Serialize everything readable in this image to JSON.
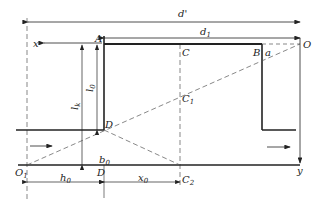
{
  "diagram": {
    "type": "geometric construction",
    "labels": {
      "d_prime": "d'",
      "d1": "d",
      "d1_sub": "1",
      "x_axis": "x",
      "y_axis": "y",
      "A": "A",
      "B": "B",
      "a": "a",
      "C": "C",
      "C1": "C",
      "C1_sub": "1",
      "C2": "C",
      "C2_sub": "2",
      "D_upper": "D",
      "D_lower": "D",
      "O": "O",
      "O1": "O",
      "O1_sub": "1",
      "lk": "l",
      "lk_sub": "k",
      "l0": "l",
      "l0_sub": "0",
      "b0": "b",
      "b0_sub": "0",
      "h0": "h",
      "h0_sub": "0",
      "x0": "x",
      "x0_sub": "0"
    },
    "colors": {
      "line": "#222222",
      "dashed": "#555555"
    }
  }
}
